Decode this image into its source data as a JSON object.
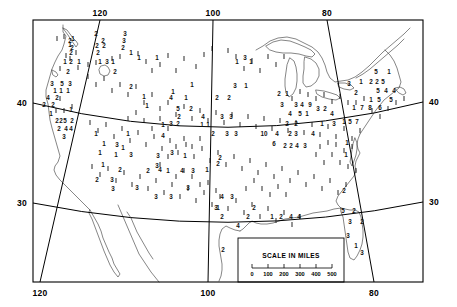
{
  "map": {
    "title": "Station data map of the contiguous United States",
    "projection_note": "conic, meridians converge toward north",
    "frame": {
      "x": 33,
      "y": 20,
      "width": 390,
      "height": 262
    },
    "colors": {
      "ink": "#000000",
      "coast": "#444444",
      "background": "#ffffff"
    }
  },
  "axes": {
    "longitude_label_top": [
      "120",
      "100",
      "80"
    ],
    "longitude_label_bottom": [
      "120",
      "100",
      "80"
    ],
    "latitude_label_left": [
      "40",
      "30"
    ],
    "latitude_label_right": [
      "40",
      "30"
    ],
    "meridians": [
      {
        "label": "120",
        "x_top": 100,
        "x_bottom": 40
      },
      {
        "label": "100",
        "x_top": 213,
        "x_bottom": 208
      },
      {
        "label": "80",
        "x_top": 327,
        "x_bottom": 374
      }
    ],
    "parallels": [
      {
        "label": "40",
        "y_left": 103,
        "y_mid": 133,
        "y_right": 102
      },
      {
        "label": "30",
        "y_left": 203,
        "y_mid": 222,
        "y_right": 202
      }
    ]
  },
  "scale_inset": {
    "title": "SCALE IN MILES",
    "ticks": [
      "0",
      "100",
      "200",
      "300",
      "400",
      "500"
    ],
    "box": {
      "x": 238,
      "y": 238,
      "width": 106,
      "height": 44
    }
  },
  "chart_data": {
    "type": "scatter",
    "title": "SCALE IN MILES",
    "xlabel": "Longitude (deg W)",
    "ylabel": "Latitude (deg N)",
    "xlim": [
      126,
      66
    ],
    "ylim": [
      24,
      50
    ],
    "grid": true,
    "legend": "none",
    "value_range": [
      1,
      9
    ],
    "note": "Each plotted mark is a station value; vertical tick glyph denotes value 1",
    "points": [
      {
        "x": 73,
        "y": 41,
        "v": "1"
      },
      {
        "x": 70,
        "y": 43,
        "v": "2"
      },
      {
        "x": 70,
        "y": 47,
        "v": "1"
      },
      {
        "x": 72,
        "y": 50,
        "v": "2"
      },
      {
        "x": 71,
        "y": 55,
        "v": "2"
      },
      {
        "x": 65,
        "y": 64,
        "v": "1"
      },
      {
        "x": 71,
        "y": 64,
        "v": "2"
      },
      {
        "x": 79,
        "y": 64,
        "v": "1"
      },
      {
        "x": 68,
        "y": 74,
        "v": "2"
      },
      {
        "x": 52,
        "y": 86,
        "v": "3"
      },
      {
        "x": 62,
        "y": 86,
        "v": "5"
      },
      {
        "x": 70,
        "y": 86,
        "v": "3"
      },
      {
        "x": 55,
        "y": 93,
        "v": "1"
      },
      {
        "x": 61,
        "y": 93,
        "v": "1"
      },
      {
        "x": 68,
        "y": 93,
        "v": "1"
      },
      {
        "x": 48,
        "y": 100,
        "v": "4"
      },
      {
        "x": 57,
        "y": 100,
        "v": "2"
      },
      {
        "x": 44,
        "y": 107,
        "v": "2"
      },
      {
        "x": 53,
        "y": 107,
        "v": "2"
      },
      {
        "x": 51,
        "y": 116,
        "v": "1"
      },
      {
        "x": 71,
        "y": 112,
        "v": "1"
      },
      {
        "x": 57,
        "y": 123,
        "v": "2"
      },
      {
        "x": 61,
        "y": 123,
        "v": "2"
      },
      {
        "x": 65,
        "y": 123,
        "v": "5"
      },
      {
        "x": 72,
        "y": 123,
        "v": "2"
      },
      {
        "x": 59,
        "y": 131,
        "v": "2"
      },
      {
        "x": 66,
        "y": 131,
        "v": "4"
      },
      {
        "x": 71,
        "y": 131,
        "v": "4"
      },
      {
        "x": 64,
        "y": 139,
        "v": "3"
      },
      {
        "x": 96,
        "y": 36,
        "v": "2"
      },
      {
        "x": 103,
        "y": 43,
        "v": "2"
      },
      {
        "x": 97,
        "y": 48,
        "v": "2"
      },
      {
        "x": 104,
        "y": 48,
        "v": "2"
      },
      {
        "x": 98,
        "y": 55,
        "v": "2"
      },
      {
        "x": 125,
        "y": 36,
        "v": "3"
      },
      {
        "x": 124,
        "y": 43,
        "v": "3"
      },
      {
        "x": 123,
        "y": 50,
        "v": "2"
      },
      {
        "x": 131,
        "y": 55,
        "v": "1"
      },
      {
        "x": 100,
        "y": 64,
        "v": "1"
      },
      {
        "x": 107,
        "y": 64,
        "v": "3"
      },
      {
        "x": 113,
        "y": 64,
        "v": "1"
      },
      {
        "x": 115,
        "y": 74,
        "v": "2"
      },
      {
        "x": 139,
        "y": 60,
        "v": "1"
      },
      {
        "x": 157,
        "y": 60,
        "v": "1"
      },
      {
        "x": 131,
        "y": 89,
        "v": "2"
      },
      {
        "x": 144,
        "y": 99,
        "v": "1"
      },
      {
        "x": 173,
        "y": 94,
        "v": "1"
      },
      {
        "x": 192,
        "y": 87,
        "v": "1"
      },
      {
        "x": 171,
        "y": 100,
        "v": "4"
      },
      {
        "x": 186,
        "y": 100,
        "v": "1"
      },
      {
        "x": 147,
        "y": 108,
        "v": "1"
      },
      {
        "x": 178,
        "y": 111,
        "v": "5"
      },
      {
        "x": 191,
        "y": 111,
        "v": "2"
      },
      {
        "x": 179,
        "y": 119,
        "v": "2"
      },
      {
        "x": 203,
        "y": 119,
        "v": "4"
      },
      {
        "x": 171,
        "y": 126,
        "v": "3"
      },
      {
        "x": 178,
        "y": 126,
        "v": "2"
      },
      {
        "x": 163,
        "y": 127,
        "v": "1"
      },
      {
        "x": 202,
        "y": 127,
        "v": "1"
      },
      {
        "x": 208,
        "y": 127,
        "v": "1"
      },
      {
        "x": 96,
        "y": 136,
        "v": "1"
      },
      {
        "x": 128,
        "y": 136,
        "v": "1"
      },
      {
        "x": 163,
        "y": 138,
        "v": "4"
      },
      {
        "x": 104,
        "y": 146,
        "v": "1"
      },
      {
        "x": 117,
        "y": 147,
        "v": "3"
      },
      {
        "x": 123,
        "y": 150,
        "v": "1"
      },
      {
        "x": 100,
        "y": 155,
        "v": "1"
      },
      {
        "x": 116,
        "y": 157,
        "v": "1"
      },
      {
        "x": 131,
        "y": 157,
        "v": "3"
      },
      {
        "x": 158,
        "y": 158,
        "v": "3"
      },
      {
        "x": 172,
        "y": 155,
        "v": "3"
      },
      {
        "x": 185,
        "y": 158,
        "v": "1"
      },
      {
        "x": 157,
        "y": 168,
        "v": "3"
      },
      {
        "x": 148,
        "y": 173,
        "v": "2"
      },
      {
        "x": 168,
        "y": 173,
        "v": "1"
      },
      {
        "x": 182,
        "y": 173,
        "v": "4"
      },
      {
        "x": 193,
        "y": 173,
        "v": "3"
      },
      {
        "x": 207,
        "y": 172,
        "v": "1"
      },
      {
        "x": 218,
        "y": 166,
        "v": "2"
      },
      {
        "x": 220,
        "y": 160,
        "v": "2"
      },
      {
        "x": 213,
        "y": 136,
        "v": "2"
      },
      {
        "x": 227,
        "y": 136,
        "v": "3"
      },
      {
        "x": 236,
        "y": 136,
        "v": "3"
      },
      {
        "x": 222,
        "y": 119,
        "v": "3"
      },
      {
        "x": 231,
        "y": 119,
        "v": "3"
      },
      {
        "x": 217,
        "y": 100,
        "v": "2"
      },
      {
        "x": 229,
        "y": 100,
        "v": "2"
      },
      {
        "x": 235,
        "y": 88,
        "v": "3"
      },
      {
        "x": 246,
        "y": 88,
        "v": "1"
      },
      {
        "x": 237,
        "y": 64,
        "v": "1"
      },
      {
        "x": 245,
        "y": 60,
        "v": "3"
      },
      {
        "x": 251,
        "y": 64,
        "v": "1"
      },
      {
        "x": 264,
        "y": 136,
        "v": "10"
      },
      {
        "x": 277,
        "y": 136,
        "v": "4"
      },
      {
        "x": 290,
        "y": 136,
        "v": "2"
      },
      {
        "x": 296,
        "y": 136,
        "v": "3"
      },
      {
        "x": 313,
        "y": 136,
        "v": "4"
      },
      {
        "x": 274,
        "y": 146,
        "v": "6"
      },
      {
        "x": 285,
        "y": 148,
        "v": "2"
      },
      {
        "x": 291,
        "y": 148,
        "v": "2"
      },
      {
        "x": 297,
        "y": 148,
        "v": "4"
      },
      {
        "x": 305,
        "y": 148,
        "v": "3"
      },
      {
        "x": 282,
        "y": 107,
        "v": "3"
      },
      {
        "x": 296,
        "y": 107,
        "v": "3"
      },
      {
        "x": 302,
        "y": 107,
        "v": "4"
      },
      {
        "x": 310,
        "y": 107,
        "v": "9"
      },
      {
        "x": 290,
        "y": 116,
        "v": "4"
      },
      {
        "x": 300,
        "y": 116,
        "v": "5"
      },
      {
        "x": 307,
        "y": 116,
        "v": "1"
      },
      {
        "x": 318,
        "y": 111,
        "v": "3"
      },
      {
        "x": 325,
        "y": 111,
        "v": "2"
      },
      {
        "x": 332,
        "y": 116,
        "v": "4"
      },
      {
        "x": 287,
        "y": 126,
        "v": "2"
      },
      {
        "x": 296,
        "y": 126,
        "v": "2"
      },
      {
        "x": 322,
        "y": 126,
        "v": "1"
      },
      {
        "x": 334,
        "y": 126,
        "v": "3"
      },
      {
        "x": 279,
        "y": 96,
        "v": "2"
      },
      {
        "x": 287,
        "y": 96,
        "v": "1"
      },
      {
        "x": 349,
        "y": 86,
        "v": "3"
      },
      {
        "x": 361,
        "y": 84,
        "v": "1"
      },
      {
        "x": 371,
        "y": 84,
        "v": "2"
      },
      {
        "x": 377,
        "y": 84,
        "v": "2"
      },
      {
        "x": 383,
        "y": 84,
        "v": "5"
      },
      {
        "x": 376,
        "y": 74,
        "v": "5"
      },
      {
        "x": 389,
        "y": 74,
        "v": "1"
      },
      {
        "x": 378,
        "y": 93,
        "v": "5"
      },
      {
        "x": 386,
        "y": 93,
        "v": "4"
      },
      {
        "x": 394,
        "y": 93,
        "v": "4"
      },
      {
        "x": 371,
        "y": 102,
        "v": "1"
      },
      {
        "x": 379,
        "y": 102,
        "v": "5"
      },
      {
        "x": 391,
        "y": 102,
        "v": "5"
      },
      {
        "x": 354,
        "y": 110,
        "v": "1"
      },
      {
        "x": 362,
        "y": 110,
        "v": "7"
      },
      {
        "x": 370,
        "y": 110,
        "v": "8"
      },
      {
        "x": 380,
        "y": 110,
        "v": "6"
      },
      {
        "x": 356,
        "y": 95,
        "v": "2"
      },
      {
        "x": 344,
        "y": 124,
        "v": "1"
      },
      {
        "x": 350,
        "y": 124,
        "v": "5"
      },
      {
        "x": 357,
        "y": 124,
        "v": "7"
      },
      {
        "x": 347,
        "y": 145,
        "v": "1"
      },
      {
        "x": 346,
        "y": 157,
        "v": "1"
      },
      {
        "x": 344,
        "y": 193,
        "v": "2"
      },
      {
        "x": 343,
        "y": 213,
        "v": "5"
      },
      {
        "x": 354,
        "y": 213,
        "v": "2"
      },
      {
        "x": 350,
        "y": 224,
        "v": "3"
      },
      {
        "x": 362,
        "y": 224,
        "v": "2"
      },
      {
        "x": 348,
        "y": 238,
        "v": "3"
      },
      {
        "x": 356,
        "y": 248,
        "v": "1"
      },
      {
        "x": 362,
        "y": 255,
        "v": "3"
      },
      {
        "x": 222,
        "y": 199,
        "v": "4"
      },
      {
        "x": 232,
        "y": 199,
        "v": "3"
      },
      {
        "x": 216,
        "y": 210,
        "v": "3"
      },
      {
        "x": 254,
        "y": 210,
        "v": "2"
      },
      {
        "x": 248,
        "y": 219,
        "v": "2"
      },
      {
        "x": 222,
        "y": 219,
        "v": "2"
      },
      {
        "x": 272,
        "y": 219,
        "v": "1"
      },
      {
        "x": 281,
        "y": 219,
        "v": "2"
      },
      {
        "x": 291,
        "y": 219,
        "v": "4"
      },
      {
        "x": 299,
        "y": 219,
        "v": "4"
      },
      {
        "x": 238,
        "y": 228,
        "v": "4"
      },
      {
        "x": 223,
        "y": 252,
        "v": "2"
      },
      {
        "x": 103,
        "y": 167,
        "v": "1"
      },
      {
        "x": 120,
        "y": 172,
        "v": "2"
      },
      {
        "x": 160,
        "y": 172,
        "v": "4"
      },
      {
        "x": 97,
        "y": 182,
        "v": "2"
      },
      {
        "x": 112,
        "y": 182,
        "v": "3"
      },
      {
        "x": 113,
        "y": 191,
        "v": "3"
      },
      {
        "x": 137,
        "y": 190,
        "v": "3"
      },
      {
        "x": 156,
        "y": 199,
        "v": "3"
      },
      {
        "x": 171,
        "y": 199,
        "v": "3"
      },
      {
        "x": 188,
        "y": 190,
        "v": "3"
      },
      {
        "x": 218,
        "y": 210,
        "v": "1"
      }
    ]
  }
}
